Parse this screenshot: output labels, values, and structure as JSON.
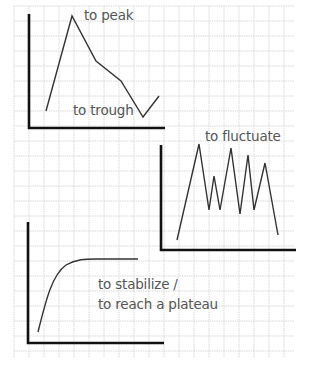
{
  "grid": {
    "x0": 14,
    "y0": 6,
    "x1": 294,
    "y1": 358,
    "cell": 15,
    "color": "#d8d8d8"
  },
  "colors": {
    "axis": "#111111",
    "line": "#333333",
    "text": "#555555"
  },
  "charts": [
    {
      "id": "peak-trough",
      "axes": {
        "origin": [
          29,
          128
        ],
        "yTop": 14,
        "xRight": 165
      },
      "points": [
        [
          46,
          111
        ],
        [
          72,
          16
        ],
        [
          96,
          61
        ],
        [
          121,
          81
        ],
        [
          143,
          117
        ],
        [
          159,
          96
        ]
      ],
      "labels": [
        {
          "text": "to peak",
          "x": 84,
          "y": 11
        },
        {
          "text": "to trough",
          "x": 73,
          "y": 106
        }
      ]
    },
    {
      "id": "fluctuate",
      "axes": {
        "origin": [
          161,
          250
        ],
        "yTop": 145,
        "xRight": 296
      },
      "points": [
        [
          177,
          240
        ],
        [
          199,
          144
        ],
        [
          209,
          210
        ],
        [
          214,
          176
        ],
        [
          220,
          210
        ],
        [
          231,
          148
        ],
        [
          240,
          214
        ],
        [
          248,
          155
        ],
        [
          254,
          210
        ],
        [
          265,
          163
        ],
        [
          278,
          235
        ]
      ],
      "labels": [
        {
          "text": "to fluctuate",
          "x": 205,
          "y": 132
        }
      ]
    },
    {
      "id": "plateau",
      "axes": {
        "origin": [
          28,
          343
        ],
        "yTop": 222,
        "xRight": 164
      },
      "curve": "M38,332 C46,300 52,275 66,265 C76,259 86,259 96,259 L138,259",
      "labels": [
        {
          "text": "to stabilize /",
          "x": 98,
          "y": 280
        },
        {
          "text": "to reach a plateau",
          "x": 98,
          "y": 300
        }
      ]
    }
  ]
}
